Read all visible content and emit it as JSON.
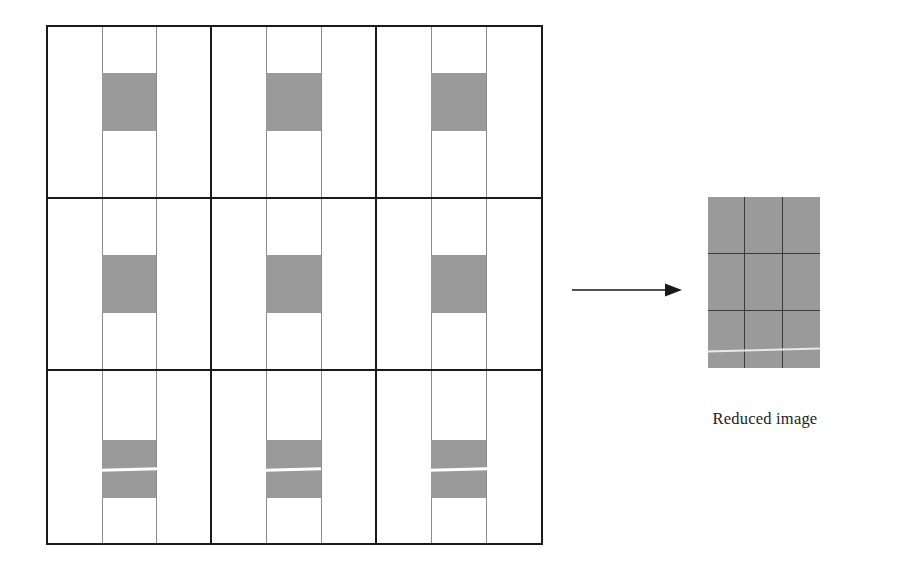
{
  "figure": {
    "type": "image-reduction-diagram",
    "background_color": "#ffffff"
  },
  "source_image": {
    "name": "Original image with 3x3 macro-blocks",
    "grid_rows": 3,
    "grid_cols": 3,
    "border_color": "#1a1a1a",
    "thin_rule_color": "#8c8c8c",
    "patch_color": "#9a9a9a",
    "seam_color": "#ffffff",
    "cells": [
      {
        "row": 0,
        "col": 0,
        "band": "top-band",
        "has_seam": false
      },
      {
        "row": 0,
        "col": 1,
        "band": "top-band",
        "has_seam": false
      },
      {
        "row": 0,
        "col": 2,
        "band": "top-band",
        "has_seam": false
      },
      {
        "row": 1,
        "col": 0,
        "band": "mid-band",
        "has_seam": false
      },
      {
        "row": 1,
        "col": 1,
        "band": "mid-band",
        "has_seam": false
      },
      {
        "row": 1,
        "col": 2,
        "band": "mid-band",
        "has_seam": false
      },
      {
        "row": 2,
        "col": 0,
        "band": "bottom-band",
        "has_seam": true
      },
      {
        "row": 2,
        "col": 1,
        "band": "bottom-band",
        "has_seam": true
      },
      {
        "row": 2,
        "col": 2,
        "band": "bottom-band",
        "has_seam": true
      }
    ]
  },
  "arrow": {
    "name": "rightward-transform-arrow",
    "direction": "right",
    "color": "#1a1a1a",
    "label": ""
  },
  "reduced_image": {
    "caption": "Reduced image",
    "grid_rows": 3,
    "grid_cols": 3,
    "fill_color": "#9a9a9a",
    "line_color": "#3b3b3b",
    "seam_color": "#e9e9e9"
  }
}
